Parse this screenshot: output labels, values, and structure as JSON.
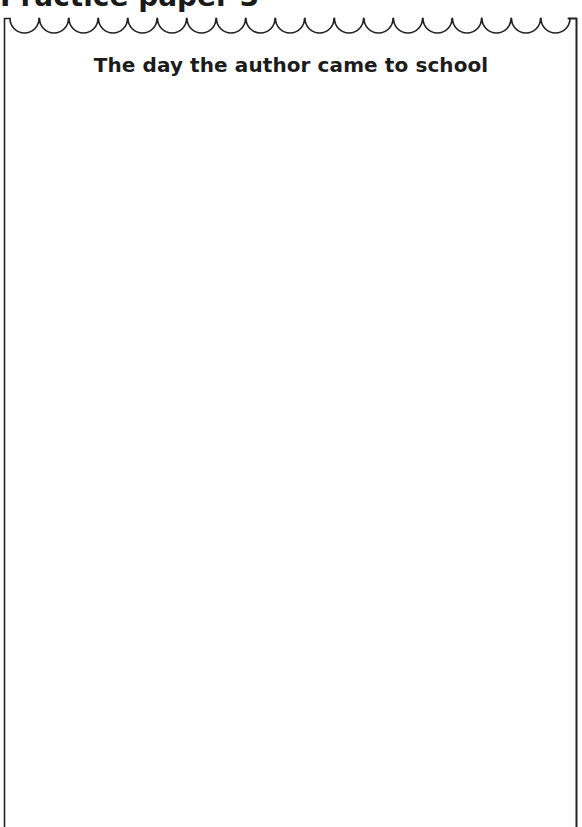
{
  "page": {
    "heading": "Practice paper 3"
  },
  "sheet": {
    "title": "The day the author came to school",
    "scallop_count": 19,
    "border_color": "#222222",
    "writing_area_content": ""
  }
}
